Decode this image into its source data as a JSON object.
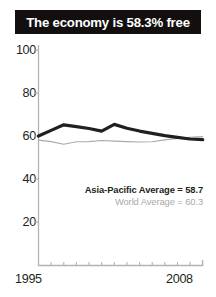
{
  "title": {
    "text": "The economy is 58.3% free",
    "background_color": "#120f0e",
    "text_color": "#ffffff"
  },
  "legend": {
    "asia_pacific": "Asia-Pacific Average = 58.7",
    "world": "World Average = 60.3",
    "asia_pacific_color": "#231f20",
    "world_color": "#a9a9a9"
  },
  "axes": {
    "y_ticks": [
      "100",
      "80",
      "60",
      "40",
      "20"
    ],
    "x_ticks": [
      "1995",
      "2008"
    ],
    "axis_color": "#b3b3b3"
  },
  "chart_data": {
    "type": "line",
    "title": "The economy is 58.3% free",
    "xlabel": "",
    "ylabel": "",
    "xlim": [
      1995,
      2008
    ],
    "ylim": [
      0,
      100
    ],
    "ytick_values": [
      20,
      40,
      60,
      80,
      100
    ],
    "xtick_values": [
      1995,
      2008
    ],
    "grid": false,
    "legend_position": "inside-lower-right",
    "x": [
      1995,
      1996,
      1997,
      1998,
      1999,
      2000,
      2001,
      2002,
      2003,
      2004,
      2005,
      2006,
      2007,
      2008
    ],
    "series": [
      {
        "name": "Asia-Pacific Average",
        "label": "Asia-Pacific Average = 58.7",
        "final_value": 58.7,
        "color": "#231f20",
        "line_width": 3.2,
        "values": [
          60.0,
          62.6,
          65.2,
          64.4,
          63.5,
          62.3,
          65.4,
          63.6,
          62.3,
          61.2,
          60.2,
          59.4,
          58.6,
          58.3
        ]
      },
      {
        "name": "World Average",
        "label": "World Average = 60.3",
        "final_value": 60.3,
        "color": "#a9a9a9",
        "line_width": 1.1,
        "values": [
          58.1,
          57.4,
          56.2,
          57.3,
          57.4,
          57.9,
          57.6,
          57.4,
          57.2,
          57.3,
          58.2,
          58.9,
          59.4,
          59.7
        ]
      }
    ]
  }
}
